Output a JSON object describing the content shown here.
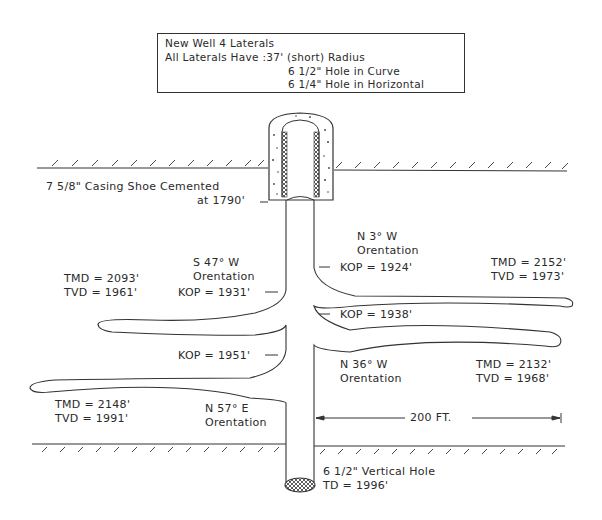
{
  "info_box": {
    "line1": "New Well 4 Laterals",
    "line2": "All Laterals Have :37' (short) Radius",
    "line3": "6 1/2\" Hole in Curve",
    "line4": "6 1/4\" Hole in Horizontal"
  },
  "casing": {
    "line1": "7 5/8\" Casing Shoe Cemented",
    "line2": "at 1790'"
  },
  "laterals": [
    {
      "id": "lateral-sw",
      "orientation_line1": "S 47° W",
      "orientation_line2": "Orentation",
      "kop": "KOP = 1931'",
      "tmd": "TMD = 2093'",
      "tvd": "TVD = 1961'"
    },
    {
      "id": "lateral-n3w",
      "orientation_line1": "N 3° W",
      "orientation_line2": "Orentation",
      "kop": "KOP = 1924'",
      "tmd": "TMD = 2152'",
      "tvd": "TVD = 1973'"
    },
    {
      "id": "lateral-n36w",
      "orientation_line1": "N 36° W",
      "orientation_line2": "Orentation",
      "kop": "KOP = 1938'",
      "tmd": "TMD = 2132'",
      "tvd": "TVD = 1968'"
    },
    {
      "id": "lateral-n57e",
      "orientation_line1": "N 57° E",
      "orientation_line2": "Orentation",
      "kop": "KOP = 1951'",
      "tmd": "TMD = 2148'",
      "tvd": "TVD = 1991'"
    }
  ],
  "scale": {
    "label": "200 FT."
  },
  "vertical_hole": {
    "line1": "6 1/2\" Vertical Hole",
    "line2": "TD = 1996'"
  },
  "colors": {
    "ink": "#2a2a2a",
    "background": "#ffffff"
  }
}
